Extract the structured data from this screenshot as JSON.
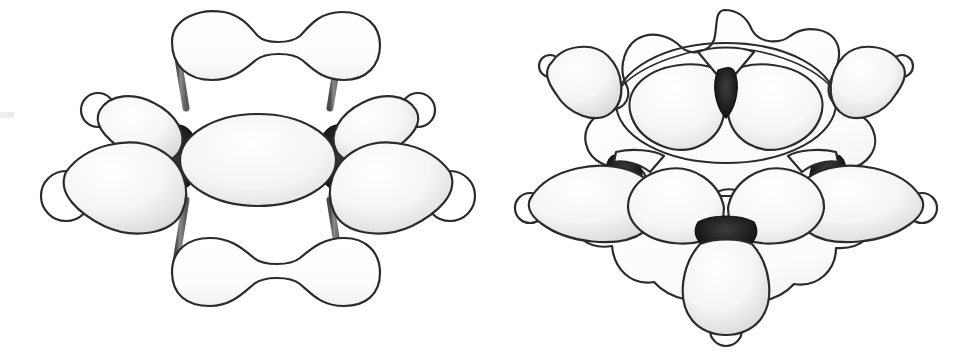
{
  "figure": {
    "background_color": "#ffffff",
    "width": 968,
    "height": 358,
    "panel_count": 2
  },
  "style": {
    "outline_color": "#2b2b2b",
    "node_color": "#1a1a1a",
    "lobe_fill_light": "#ffffff",
    "lobe_fill_shade": "#e4e4e4",
    "pi_cloud_fill": "#fdfdfd",
    "bond_stick_color": "#6b6b6b",
    "hydrogen_fill": "#ffffff",
    "outline_width": 2.2
  },
  "panels": [
    {
      "id": "side-view",
      "name": "benzene-side-view",
      "description": "Side-on view of benzene showing the pi electron cloud as two bone-shaped lobes above and below the planar sigma framework",
      "lobe_count": 6,
      "hydrogen_count": 4,
      "node_count": 2,
      "pi_lobes": [
        {
          "name": "pi-cloud-top",
          "shape": "bone"
        },
        {
          "name": "pi-cloud-bottom",
          "shape": "bone"
        }
      ],
      "sigma_lobes": [
        {
          "name": "sigma-lobe-center",
          "shape": "ellipse"
        },
        {
          "name": "sigma-lobe-left-outer",
          "shape": "teardrop"
        },
        {
          "name": "sigma-lobe-left-upper",
          "shape": "teardrop"
        },
        {
          "name": "sigma-lobe-right-outer",
          "shape": "teardrop"
        },
        {
          "name": "sigma-lobe-right-upper",
          "shape": "teardrop"
        }
      ],
      "bonds": [
        {
          "name": "bond-stick-upper-left"
        },
        {
          "name": "bond-stick-lower-left"
        },
        {
          "name": "bond-stick-upper-right"
        },
        {
          "name": "bond-stick-lower-right"
        }
      ]
    },
    {
      "id": "top-view",
      "name": "benzene-top-view",
      "description": "Perspective top view of benzene showing the hexagonal scalloped pi cloud with sp2 sigma orbitals radiating outward and hydrogen atoms at the tips",
      "lobe_count": 7,
      "hydrogen_count": 5,
      "node_count": 3,
      "pi_cloud": {
        "name": "pi-cloud-hexagon",
        "shape": "scalloped-hexagon"
      },
      "sigma_lobes": [
        {
          "name": "sigma-lobe-upper-left",
          "shape": "teardrop"
        },
        {
          "name": "sigma-lobe-upper-right",
          "shape": "teardrop"
        },
        {
          "name": "sigma-lobe-mid-left-outer",
          "shape": "teardrop"
        },
        {
          "name": "sigma-lobe-mid-right-outer",
          "shape": "teardrop"
        },
        {
          "name": "sigma-lobe-mid-left-inner",
          "shape": "teardrop"
        },
        {
          "name": "sigma-lobe-mid-right-inner",
          "shape": "teardrop"
        },
        {
          "name": "sigma-lobe-bottom",
          "shape": "teardrop"
        },
        {
          "name": "sigma-lobe-ring-left-inner",
          "shape": "teardrop"
        },
        {
          "name": "sigma-lobe-ring-right-inner",
          "shape": "teardrop"
        }
      ]
    }
  ],
  "artifacts": {
    "left_edge_smudge": {
      "name": "scan-artifact",
      "color": "#ededed"
    }
  }
}
